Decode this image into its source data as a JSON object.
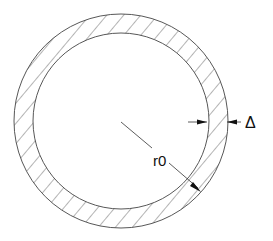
{
  "diagram": {
    "type": "cross-section of hollow circular tube (annulus) with hatching",
    "labels": {
      "radius": "r0",
      "thickness": "Δ"
    },
    "geometry": {
      "center": [
        121,
        121
      ],
      "outer_radius": 107,
      "inner_radius": 88
    },
    "colors": {
      "stroke": "#333333",
      "background": "#ffffff"
    }
  }
}
